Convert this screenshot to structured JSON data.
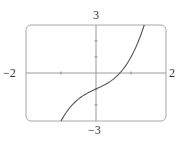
{
  "chart_data": {
    "type": "line",
    "title": "",
    "xlabel": "",
    "ylabel": "",
    "xlim": [
      -2,
      2
    ],
    "ylim": [
      -3,
      3
    ],
    "grid": false,
    "legend": null,
    "axis_labels": {
      "x_min": "−2",
      "x_max": "2",
      "y_min": "−3",
      "y_max": "3"
    },
    "x_ticks": [
      -1,
      1
    ],
    "y_ticks": [
      -2,
      -1,
      1,
      2
    ],
    "series": [
      {
        "name": "f(x) = x^3 + x - 1",
        "x": [
          -1.0,
          -0.75,
          -0.5,
          -0.25,
          0.0,
          0.25,
          0.5,
          0.68,
          0.75,
          1.0,
          1.25,
          1.38
        ],
        "y": [
          -3.0,
          -2.17,
          -1.63,
          -1.27,
          -1.0,
          -0.73,
          -0.38,
          0.0,
          0.17,
          1.0,
          2.2,
          3.0
        ]
      }
    ],
    "colors": {
      "frame": "#9a9a9a",
      "axes": "#9a9a9a",
      "curve": "#555555"
    }
  }
}
